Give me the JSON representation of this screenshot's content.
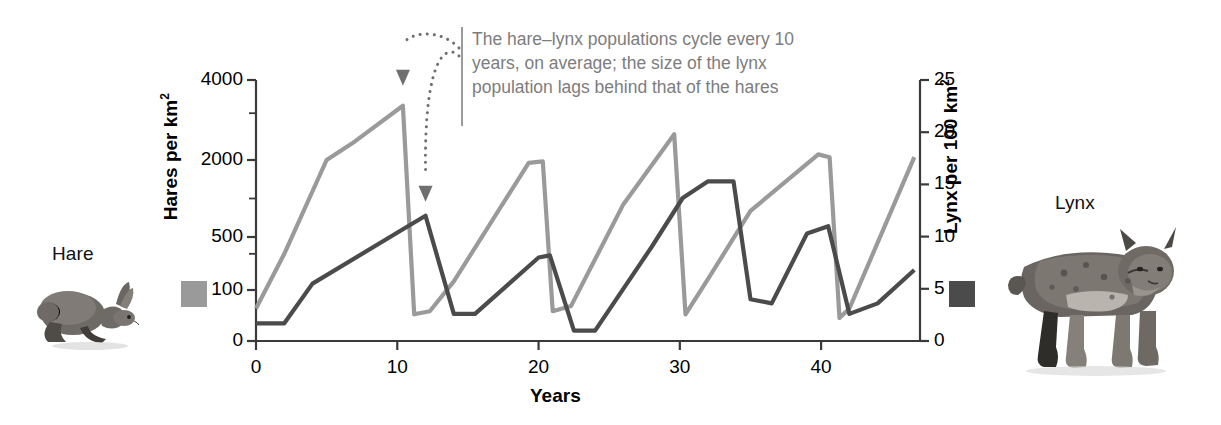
{
  "figure": {
    "x_title": "Years",
    "y_left_title_main": "Hares per km",
    "y_left_title_sup": "2",
    "y_right_title_main": "Lynx per 100 km",
    "y_right_title_sup": "2",
    "annotation": "The hare–lynx populations cycle every 10 years, on average; the size of the lynx population lags behind that of the hares",
    "hare_label": "Hare",
    "lynx_label": "Lynx",
    "hare_color": "#9a9a9a",
    "lynx_color": "#4b4b4b",
    "annotation_color": "#7d7d7d",
    "axis_color": "#3a3a3a"
  },
  "ticks": {
    "left": [
      "4000",
      "2000",
      "500",
      "100",
      "0"
    ],
    "right": [
      "25",
      "20",
      "15",
      "10",
      "5",
      "0"
    ],
    "bottom": [
      "0",
      "10",
      "20",
      "30",
      "40"
    ]
  },
  "chart_data": {
    "type": "line",
    "title": "",
    "xlabel": "Years",
    "ylabel": "Hares per km2",
    "y2label": "Lynx per 100 km2",
    "grid": false,
    "legend_position": "outside-left-and-right",
    "xlim": [
      0,
      47
    ],
    "left_axis": {
      "label": "Hares per km2",
      "scale": "log-like",
      "tick_values": [
        0,
        100,
        500,
        2000,
        4000
      ],
      "minor_ticks": [
        300,
        1000,
        3000
      ]
    },
    "right_axis": {
      "label": "Lynx per 100 km2",
      "scale": "linear",
      "ylim": [
        0,
        25
      ],
      "tick_values": [
        0,
        5,
        10,
        15,
        20,
        25
      ]
    },
    "annotations": [
      {
        "text": "The hare–lynx populations cycle every 10 years, on average; the size of the lynx population lags behind that of the hares",
        "arrows": [
          {
            "points_to_series": "Hare",
            "points_to_x": 10.4,
            "note": "hare peak"
          },
          {
            "points_to_series": "Lynx",
            "points_to_x": 12.0,
            "note": "lynx peak, lagging"
          }
        ]
      }
    ],
    "series": [
      {
        "name": "Hare",
        "axis": "left",
        "color": "#9a9a9a",
        "units": "hares per km2",
        "points": [
          {
            "x": 0.0,
            "y": 40
          },
          {
            "x": 2.0,
            "y": 300
          },
          {
            "x": 5.0,
            "y": 2000
          },
          {
            "x": 7.0,
            "y": 2350
          },
          {
            "x": 10.4,
            "y": 3200
          },
          {
            "x": 11.2,
            "y": 30
          },
          {
            "x": 12.3,
            "y": 35
          },
          {
            "x": 14.0,
            "y": 130
          },
          {
            "x": 19.3,
            "y": 1900
          },
          {
            "x": 20.3,
            "y": 1950
          },
          {
            "x": 21.0,
            "y": 35
          },
          {
            "x": 22.3,
            "y": 45
          },
          {
            "x": 26.0,
            "y": 900
          },
          {
            "x": 29.6,
            "y": 2500
          },
          {
            "x": 30.4,
            "y": 30
          },
          {
            "x": 32.0,
            "y": 140
          },
          {
            "x": 35.0,
            "y": 800
          },
          {
            "x": 39.8,
            "y": 2100
          },
          {
            "x": 40.6,
            "y": 2050
          },
          {
            "x": 41.3,
            "y": 25
          },
          {
            "x": 42.0,
            "y": 40
          },
          {
            "x": 46.6,
            "y": 2050
          }
        ]
      },
      {
        "name": "Lynx",
        "axis": "right",
        "color": "#4b4b4b",
        "units": "lynx per 100 km2",
        "points": [
          {
            "x": 0.0,
            "y": 1.7
          },
          {
            "x": 2.0,
            "y": 1.7
          },
          {
            "x": 4.0,
            "y": 5.5
          },
          {
            "x": 10.4,
            "y": 10.7
          },
          {
            "x": 12.0,
            "y": 12.0
          },
          {
            "x": 14.0,
            "y": 2.6
          },
          {
            "x": 15.5,
            "y": 2.6
          },
          {
            "x": 20.0,
            "y": 8.0
          },
          {
            "x": 20.8,
            "y": 8.2
          },
          {
            "x": 22.5,
            "y": 1.0
          },
          {
            "x": 24.0,
            "y": 1.0
          },
          {
            "x": 28.0,
            "y": 9.0
          },
          {
            "x": 30.2,
            "y": 13.7
          },
          {
            "x": 32.0,
            "y": 15.3
          },
          {
            "x": 33.8,
            "y": 15.3
          },
          {
            "x": 35.0,
            "y": 4.0
          },
          {
            "x": 36.5,
            "y": 3.6
          },
          {
            "x": 39.0,
            "y": 10.3
          },
          {
            "x": 40.5,
            "y": 11.0
          },
          {
            "x": 42.0,
            "y": 2.6
          },
          {
            "x": 44.0,
            "y": 3.6
          },
          {
            "x": 46.6,
            "y": 6.8
          }
        ]
      }
    ]
  }
}
